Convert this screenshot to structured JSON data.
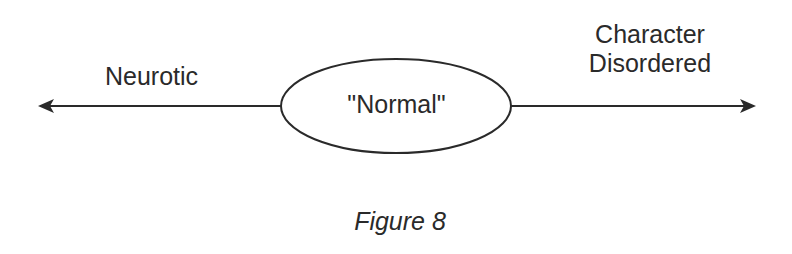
{
  "diagram": {
    "left_label": "Neurotic",
    "center_label": "\"Normal\"",
    "right_label_line1": "Character",
    "right_label_line2": "Disordered",
    "caption": "Figure 8",
    "stroke_color": "#2a2a2a"
  }
}
